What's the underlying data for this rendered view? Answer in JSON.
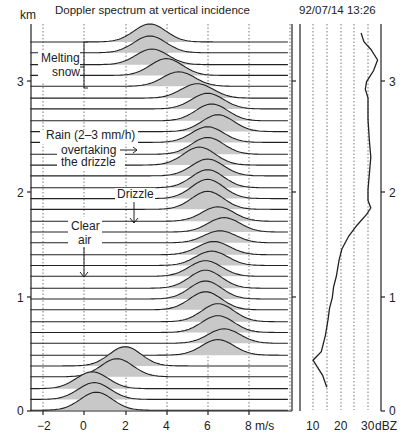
{
  "chart_data": [
    {
      "type": "area",
      "title": "Doppler spectrum at vertical incidence",
      "xlabel": "m/s",
      "ylabel": "km",
      "xlim": [
        -2.6,
        9.9
      ],
      "ylim": [
        0,
        3.45
      ],
      "xticks": [
        -2,
        0,
        2,
        4,
        6,
        8
      ],
      "xtick_labels": [
        "−2",
        "0",
        "2",
        "4",
        "6",
        "8 m/s"
      ],
      "yticks": [
        0,
        1,
        2,
        3
      ],
      "grid": "vertical dotted at x ticks",
      "num_spectra": 36,
      "annotations": [
        {
          "text": "Melting\nsnow",
          "bracket": true
        },
        {
          "text": "Rain (2–3 mm/h)\novertaking\nthe drizzle",
          "arrow": "right"
        },
        {
          "text": "Drizzle",
          "arrow": "down"
        },
        {
          "text": "Clear\nair",
          "arrow": "down"
        }
      ],
      "spectra_peaks": [
        {
          "height_km": 3.38,
          "peak_ms": 3.2,
          "amp": 0.75
        },
        {
          "height_km": 3.28,
          "peak_ms": 3.2,
          "amp": 0.7
        },
        {
          "height_km": 3.17,
          "peak_ms": 3.3,
          "amp": 0.65
        },
        {
          "height_km": 3.07,
          "peak_ms": 4.0,
          "amp": 0.7
        },
        {
          "height_km": 2.97,
          "peak_ms": 4.6,
          "amp": 0.6
        },
        {
          "height_km": 2.86,
          "peak_ms": 5.5,
          "amp": 0.6
        },
        {
          "height_km": 2.76,
          "peak_ms": 6.0,
          "amp": 0.65
        },
        {
          "height_km": 2.65,
          "peak_ms": 6.2,
          "amp": 0.7
        },
        {
          "height_km": 2.55,
          "peak_ms": 6.5,
          "amp": 0.7
        },
        {
          "height_km": 2.45,
          "peak_ms": 6.0,
          "amp": 0.65
        },
        {
          "height_km": 2.34,
          "peak_ms": 6.0,
          "amp": 0.7
        },
        {
          "height_km": 2.24,
          "peak_ms": 5.6,
          "amp": 0.75
        },
        {
          "height_km": 2.14,
          "peak_ms": 6.0,
          "amp": 0.7
        },
        {
          "height_km": 2.03,
          "peak_ms": 6.0,
          "amp": 0.75
        },
        {
          "height_km": 1.93,
          "peak_ms": 6.0,
          "amp": 0.8
        },
        {
          "height_km": 1.83,
          "peak_ms": 6.0,
          "amp": 0.75
        },
        {
          "height_km": 1.72,
          "peak_ms": 6.5,
          "amp": 0.6
        },
        {
          "height_km": 1.62,
          "peak_ms": 6.8,
          "amp": 0.6
        },
        {
          "height_km": 1.52,
          "peak_ms": 6.6,
          "amp": 0.5
        },
        {
          "height_km": 1.41,
          "peak_ms": 6.3,
          "amp": 0.55
        },
        {
          "height_km": 1.31,
          "peak_ms": 6.2,
          "amp": 0.6
        },
        {
          "height_km": 1.21,
          "peak_ms": 5.9,
          "amp": 0.65
        },
        {
          "height_km": 1.1,
          "peak_ms": 5.9,
          "amp": 0.75
        },
        {
          "height_km": 1.0,
          "peak_ms": 5.9,
          "amp": 0.75
        },
        {
          "height_km": 0.9,
          "peak_ms": 5.9,
          "amp": 0.75
        },
        {
          "height_km": 0.79,
          "peak_ms": 6.5,
          "amp": 0.75
        },
        {
          "height_km": 0.69,
          "peak_ms": 6.5,
          "amp": 0.7
        },
        {
          "height_km": 0.59,
          "peak_ms": 6.8,
          "amp": 0.6
        },
        {
          "height_km": 0.48,
          "peak_ms": 6.5,
          "amp": 0.65
        },
        {
          "height_km": 0.38,
          "peak_ms": 2.0,
          "amp": 0.8
        },
        {
          "height_km": 0.28,
          "peak_ms": 1.6,
          "amp": 0.75
        },
        {
          "height_km": 0.17,
          "peak_ms": 0.4,
          "amp": 0.7
        },
        {
          "height_km": 0.07,
          "peak_ms": 0.5,
          "amp": 0.7
        },
        {
          "height_km": -0.03,
          "peak_ms": 0.6,
          "amp": 0.75
        }
      ]
    },
    {
      "type": "line",
      "title": "92/07/14  13:26",
      "xlabel": "dBZ",
      "ylabel": "km",
      "xticks": [
        10,
        20,
        30
      ],
      "xtick_labels": [
        "10",
        "20",
        "30 dBZ"
      ],
      "grid_x": [
        10,
        15,
        20,
        25,
        30
      ],
      "xlim": [
        3,
        34
      ],
      "ylim": [
        0,
        3.45
      ],
      "yticks": [
        0,
        1,
        2,
        3
      ],
      "x": [
        15,
        13.5,
        10,
        13,
        14.5,
        15.5,
        16,
        17,
        17.5,
        18.5,
        19.5,
        20.5,
        23,
        26,
        29.5,
        31,
        30,
        30,
        30.5,
        31,
        30.5,
        30,
        30,
        30,
        29,
        29.5,
        32,
        33.5,
        31,
        28.5,
        27.5
      ],
      "y": [
        0.22,
        0.33,
        0.47,
        0.55,
        0.7,
        0.85,
        0.95,
        1.05,
        1.15,
        1.25,
        1.4,
        1.5,
        1.62,
        1.72,
        1.82,
        1.88,
        1.95,
        2.05,
        2.2,
        2.35,
        2.5,
        2.7,
        2.8,
        2.9,
        2.98,
        3.05,
        3.15,
        3.25,
        3.35,
        3.42,
        3.5
      ]
    }
  ],
  "header": {
    "spectrum_title": "Doppler spectrum at vertical incidence",
    "date_time": "92/07/14  13:26",
    "y_unit": "km"
  },
  "left_axis": {
    "ticks": [
      "0",
      "1",
      "2",
      "3"
    ]
  },
  "bottom_axis": {
    "ticks": [
      "−2",
      "0",
      "2",
      "4",
      "6",
      "8 m/s"
    ]
  },
  "right_axis": {
    "ticks": [
      "0",
      "1",
      "2",
      "3"
    ]
  },
  "dbz_axis": {
    "ticks": [
      "10",
      "20",
      "30",
      "dBZ"
    ]
  },
  "annotations": {
    "melting_line1": "Melting",
    "melting_line2": "snow",
    "rain_line1": "Rain (2–3 mm/h)",
    "rain_line2": "overtaking",
    "rain_line3": "the drizzle",
    "drizzle": "Drizzle",
    "clear_line1": "Clear",
    "clear_line2": "air"
  },
  "colors": {
    "line": "#222222",
    "fill": "#c8c8c8",
    "grid": "#555555",
    "background": "#ffffff"
  }
}
